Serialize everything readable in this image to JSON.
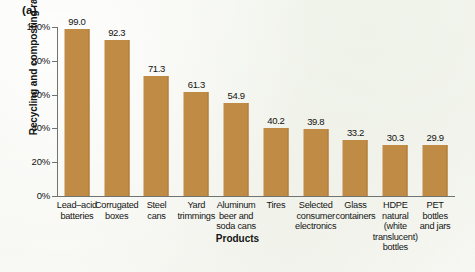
{
  "panel": {
    "label": "(a)"
  },
  "axis_title": {
    "x": "Products",
    "y": "Recycling and composting rate"
  },
  "y_ticks": [
    {
      "label": "100%",
      "value": 100
    },
    {
      "label": "80%",
      "value": 80
    },
    {
      "label": "60%",
      "value": 60
    },
    {
      "label": "40%",
      "value": 40
    },
    {
      "label": "20%",
      "value": 20
    },
    {
      "label": "0%",
      "value": 0
    }
  ],
  "colors": {
    "bar": "#c08b45",
    "bar_edge": "#ab7837",
    "axis": "#6f7470",
    "text": "#141414",
    "background": "#f7f8f2"
  },
  "chart_data": {
    "type": "bar",
    "title": "(a)",
    "xlabel": "Products",
    "ylabel": "Recycling and composting rate",
    "ylim": [
      0,
      100
    ],
    "ytick_labels": [
      "0%",
      "20%",
      "40%",
      "60%",
      "80%",
      "100%"
    ],
    "grid": false,
    "legend": false,
    "value_suffix": "%",
    "categories": [
      "Lead–acid batteries",
      "Corrugated boxes",
      "Steel cans",
      "Yard trimmings",
      "Aluminum beer and soda cans",
      "Tires",
      "Selected consumer electronics",
      "Glass containers",
      "HDPE natural (white translucent) bottles",
      "PET bottles and jars"
    ],
    "category_lines": [
      [
        "Lead–acid",
        "batteries"
      ],
      [
        "Corrugated",
        "boxes"
      ],
      [
        "Steel",
        "cans"
      ],
      [
        "Yard",
        "trimmings"
      ],
      [
        "Aluminum",
        "beer and",
        "soda cans"
      ],
      [
        "Tires"
      ],
      [
        "Selected",
        "consumer",
        "electronics"
      ],
      [
        "Glass",
        "containers"
      ],
      [
        "HDPE",
        "natural",
        "(white",
        "translucent)",
        "bottles"
      ],
      [
        "PET",
        "bottles",
        "and jars"
      ]
    ],
    "values": [
      99.0,
      92.3,
      71.3,
      61.3,
      54.9,
      40.2,
      39.8,
      33.2,
      30.3,
      29.9
    ],
    "value_labels": [
      "99.0",
      "92.3",
      "71.3",
      "61.3",
      "54.9",
      "40.2",
      "39.8",
      "33.2",
      "30.3",
      "29.9"
    ]
  }
}
